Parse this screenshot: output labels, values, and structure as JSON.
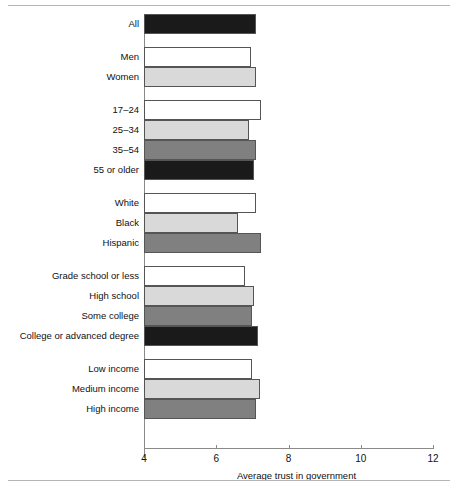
{
  "figure": {
    "xlabel": "Average trust in government",
    "xticks": [
      "4",
      "6",
      "8",
      "10",
      "12"
    ]
  },
  "chart_data": {
    "type": "bar",
    "orientation": "horizontal",
    "title": "",
    "xlabel": "Average trust in government",
    "ylabel": "",
    "xlim": [
      4,
      12
    ],
    "xticks": [
      4,
      6,
      8,
      10,
      12
    ],
    "grid": false,
    "legend": "none",
    "groups": [
      {
        "name": "Overall",
        "bars": [
          {
            "label": "All",
            "value": 7.1,
            "fill": "#1a1a1a"
          }
        ]
      },
      {
        "name": "Gender",
        "bars": [
          {
            "label": "Men",
            "value": 6.95,
            "fill": "#ffffff"
          },
          {
            "label": "Women",
            "value": 7.1,
            "fill": "#d9d9d9"
          }
        ]
      },
      {
        "name": "Age",
        "bars": [
          {
            "label": "17–24",
            "value": 7.25,
            "fill": "#ffffff"
          },
          {
            "label": "25–34",
            "value": 6.9,
            "fill": "#d9d9d9"
          },
          {
            "label": "35–54",
            "value": 7.1,
            "fill": "#808080"
          },
          {
            "label": "55 or older",
            "value": 7.05,
            "fill": "#1a1a1a"
          }
        ]
      },
      {
        "name": "Race/ethnicity",
        "bars": [
          {
            "label": "White",
            "value": 7.1,
            "fill": "#ffffff"
          },
          {
            "label": "Black",
            "value": 6.6,
            "fill": "#d9d9d9"
          },
          {
            "label": "Hispanic",
            "value": 7.25,
            "fill": "#808080"
          }
        ]
      },
      {
        "name": "Education",
        "bars": [
          {
            "label": "Grade school or less",
            "value": 6.8,
            "fill": "#ffffff"
          },
          {
            "label": "High school",
            "value": 7.05,
            "fill": "#d9d9d9"
          },
          {
            "label": "Some college",
            "value": 7.0,
            "fill": "#808080"
          },
          {
            "label": "College or advanced degree",
            "value": 7.15,
            "fill": "#1a1a1a"
          }
        ]
      },
      {
        "name": "Income",
        "bars": [
          {
            "label": "Low income",
            "value": 7.0,
            "fill": "#ffffff"
          },
          {
            "label": "Medium income",
            "value": 7.2,
            "fill": "#d9d9d9"
          },
          {
            "label": "High income",
            "value": 7.1,
            "fill": "#808080"
          }
        ]
      }
    ]
  }
}
